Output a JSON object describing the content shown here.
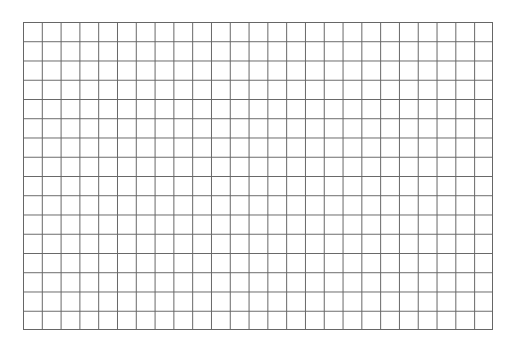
{
  "grid": {
    "columns": 25,
    "rows": 16,
    "line_color": "#666666",
    "background_color": "#ffffff"
  }
}
